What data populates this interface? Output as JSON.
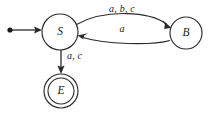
{
  "diagram": {
    "type": "finite-state-machine",
    "background_color": "#ffffff",
    "stroke_color": "#2b2b2b",
    "text_color": "#1a1a1a",
    "start_state": "S",
    "accepting_states": [
      "E"
    ],
    "states": [
      {
        "id": "S",
        "label": "S",
        "shape": "circle",
        "is_start": true,
        "is_accepting": false,
        "cx": 60,
        "cy": 32,
        "r": 18
      },
      {
        "id": "B",
        "label": "B",
        "shape": "circle",
        "is_start": false,
        "is_accepting": false,
        "cx": 186,
        "cy": 33,
        "r": 16
      },
      {
        "id": "E",
        "label": "E",
        "shape": "double-circle",
        "is_start": false,
        "is_accepting": true,
        "cx": 61,
        "cy": 91,
        "r": 17,
        "r_inner": 13
      }
    ],
    "transitions": [
      {
        "id": "s-to-b",
        "from": "S",
        "to": "B",
        "label": "a, b, c",
        "symbols": [
          "a",
          "b",
          "c"
        ],
        "curve": "arc-up",
        "label_x": 122,
        "label_y": 10
      },
      {
        "id": "b-to-s",
        "from": "B",
        "to": "S",
        "label": "a",
        "symbols": [
          "a"
        ],
        "curve": "arc-down",
        "label_x": 122,
        "label_y": 30
      },
      {
        "id": "s-to-e",
        "from": "S",
        "to": "E",
        "label": "a, c",
        "symbols": [
          "a",
          "c"
        ],
        "curve": "straight-down",
        "label_x": 67,
        "label_y": 57
      }
    ],
    "start_marker": {
      "name": "start-dot",
      "dot_x": 10,
      "dot_y": 30,
      "dot_r": 2.6,
      "line_to_x": 42
    }
  }
}
